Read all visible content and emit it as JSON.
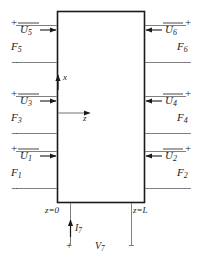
{
  "figure": {
    "type": "circuit-block-diagram",
    "line_color": "#1a1a1a",
    "background": "#ffffff"
  },
  "block": {
    "name": "network-block",
    "x": 57,
    "y": 11,
    "width": 88,
    "height": 192
  },
  "axes": {
    "x_axis": {
      "label": "x",
      "direction": "up"
    },
    "z_axis": {
      "label": "z",
      "direction": "right"
    }
  },
  "boundaries": {
    "left": "z=0",
    "right": "z=L"
  },
  "ports": [
    {
      "id": "port5",
      "side": "left",
      "voltage": "U",
      "voltage_sub": "5",
      "force": "F",
      "force_sub": "5",
      "arrow": "right",
      "top_sign": "+",
      "bottom_sign": "−"
    },
    {
      "id": "port6",
      "side": "right",
      "voltage": "U",
      "voltage_sub": "6",
      "force": "F",
      "force_sub": "6",
      "arrow": "left",
      "top_sign": "+",
      "bottom_sign": "−"
    },
    {
      "id": "port3",
      "side": "left",
      "voltage": "U",
      "voltage_sub": "3",
      "force": "F",
      "force_sub": "3",
      "arrow": "right",
      "top_sign": "+",
      "bottom_sign": "−"
    },
    {
      "id": "port4",
      "side": "right",
      "voltage": "U",
      "voltage_sub": "4",
      "force": "F",
      "force_sub": "4",
      "arrow": "left",
      "top_sign": "+",
      "bottom_sign": "−"
    },
    {
      "id": "port1",
      "side": "left",
      "voltage": "U",
      "voltage_sub": "1",
      "force": "F",
      "force_sub": "1",
      "arrow": "right",
      "top_sign": "+",
      "bottom_sign": "−"
    },
    {
      "id": "port2",
      "side": "right",
      "voltage": "U",
      "voltage_sub": "2",
      "force": "F",
      "force_sub": "2",
      "arrow": "left",
      "top_sign": "+",
      "bottom_sign": "−"
    }
  ],
  "bottom_port": {
    "id": "port7",
    "current": "I",
    "current_sub": "7",
    "current_arrow": "up",
    "voltage": "V",
    "voltage_sub": "7",
    "left_sign": "+",
    "right_sign": "−"
  }
}
